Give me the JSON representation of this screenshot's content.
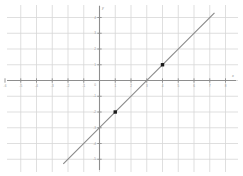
{
  "chart_data": {
    "type": "line",
    "title": "",
    "xlabel": "x",
    "ylabel": "y",
    "grid": true,
    "legend": null,
    "xlim": [
      -6.2,
      9.0
    ],
    "ylim": [
      -5.9,
      5.1
    ],
    "xticks": [
      -6,
      -5,
      -4,
      -3,
      -2,
      -1,
      1,
      2,
      3,
      4,
      5,
      6,
      7,
      8
    ],
    "yticks": [
      -5,
      -4,
      -3,
      -2,
      -1,
      1,
      2,
      3,
      4
    ],
    "xtick_labels": [
      "-6",
      "-5",
      "-4",
      "-3",
      "-2",
      "-1",
      "1",
      "2",
      "3",
      "4",
      "5",
      "6",
      "7",
      "8"
    ],
    "ytick_labels": [
      "-5",
      "-4",
      "-3",
      "-2",
      "-1",
      "1",
      "2",
      "3",
      "4"
    ],
    "origin_label": "0",
    "series": [
      {
        "name": "y = x - 3",
        "slope": 1,
        "intercept": -3,
        "x": [
          -2.3,
          7.3
        ],
        "values": [
          -5.3,
          4.3
        ]
      }
    ],
    "points": [
      {
        "label": "(1, -2)",
        "x": 1,
        "y": -2
      },
      {
        "label": "(4, 1)",
        "x": 4,
        "y": 1
      }
    ],
    "intercepts": {
      "x_intercept": 3,
      "y_intercept": -3
    },
    "colors": {
      "grid": "#d7d7d7",
      "axis": "#8e8e8e",
      "line": "#8a8a8a",
      "marker": "#1a1a1a",
      "label": "#9a9a9a",
      "background": "#ffffff"
    }
  }
}
